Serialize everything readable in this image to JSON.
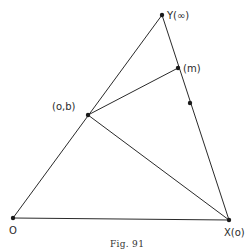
{
  "figure": {
    "caption": "Fig. 91",
    "points": {
      "O": {
        "label": "O",
        "x": 13,
        "y": 218
      },
      "X": {
        "label": "X(o)",
        "x": 229,
        "y": 220
      },
      "Y": {
        "label": "Y(∞)",
        "x": 162,
        "y": 15
      },
      "B": {
        "label": "(o,b)",
        "x": 88,
        "y": 115
      },
      "M": {
        "label": "(m)",
        "x": 178,
        "y": 68
      },
      "D": {
        "label": "",
        "x": 190,
        "y": 103
      }
    },
    "segments": [
      [
        "O",
        "X"
      ],
      [
        "O",
        "Y"
      ],
      [
        "Y",
        "X"
      ],
      [
        "B",
        "M"
      ],
      [
        "B",
        "X"
      ]
    ],
    "line_color": "#2a2a2a"
  }
}
